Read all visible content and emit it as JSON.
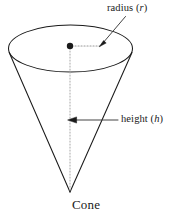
{
  "figure": {
    "name": "cone-diagram",
    "caption": "Cone",
    "background_color": "#ffffff",
    "stroke_color": "#1a1a1a",
    "dotted_color": "#8c8c8c",
    "labels": {
      "radius": {
        "text": "radius",
        "variable": "r",
        "open_paren": "(",
        "close_paren": ")"
      },
      "height": {
        "text": "height",
        "variable": "h",
        "open_paren": "(",
        "close_paren": ")"
      }
    },
    "geometry": {
      "ellipse_center_x": 70.5,
      "ellipse_center_y": 48.5,
      "ellipse_rx": 62,
      "ellipse_ry": 23.5,
      "apex_x": 70,
      "apex_y": 192,
      "center_dot_x": 70,
      "center_dot_y": 46,
      "center_dot_r": 3.2,
      "radius_dotted_end_x": 101,
      "height_arrow_y": 120,
      "height_arrow_tip_x": 68,
      "height_arrow_tail_x": 118,
      "radius_leader_start_x": 124,
      "radius_leader_start_y": 16,
      "radius_leader_tip_x": 100,
      "radius_leader_tip_y": 45
    }
  }
}
